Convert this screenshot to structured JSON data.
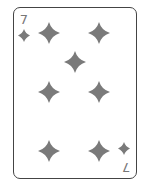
{
  "card": {
    "rank": "7",
    "suit": "diamonds",
    "suit_icon": "diamond-icon",
    "pip_color": "#7a7a7a",
    "border_color": "#444444",
    "pip_count": 7
  }
}
